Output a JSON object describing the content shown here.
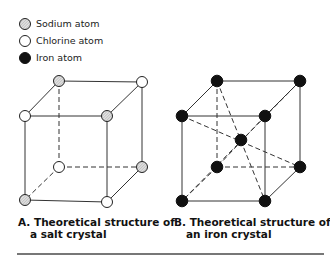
{
  "legend": {
    "items": [
      {
        "label": "Sodium atom",
        "type": "sodium",
        "icon": "hatched-circle-icon"
      },
      {
        "label": "Chlorine atom",
        "type": "chlorine",
        "icon": "open-circle-icon"
      },
      {
        "label": "Iron atom",
        "type": "iron",
        "icon": "filled-circle-icon"
      }
    ]
  },
  "colors": {
    "line": "#333333",
    "iron": "#111111",
    "chlorine_fill": "#ffffff",
    "sodium_fill": "#d0d0d0",
    "rule": "#777777"
  },
  "figures": [
    {
      "id": "A",
      "caption_line1": "A. Theoretical structure of",
      "caption_line2": "a salt crystal",
      "lattice": "simple cubic",
      "atoms": {
        "back_top_left": "sodium",
        "back_top_right": "chlorine",
        "front_top_left": "chlorine",
        "front_top_right": "sodium",
        "back_bottom_left": "chlorine",
        "back_bottom_right": "sodium",
        "front_bottom_left": "sodium",
        "front_bottom_right": "chlorine"
      }
    },
    {
      "id": "B",
      "caption_line1": "B. Theoretical structure of",
      "caption_line2": "an iron crystal",
      "lattice": "body-centered cubic",
      "atoms": {
        "corners": "iron",
        "center": "iron"
      }
    }
  ]
}
